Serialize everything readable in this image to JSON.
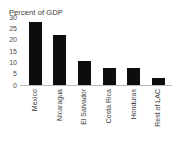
{
  "chart_data": {
    "type": "bar",
    "title": "Percent of GDP",
    "xlabel": "",
    "ylabel": "",
    "ylim": [
      0,
      30
    ],
    "yticks": [
      30,
      25,
      20,
      15,
      10,
      5,
      0
    ],
    "grid": false,
    "legend": false,
    "bar_color": "#0d0d0d",
    "axis_color": "#b9b9b9",
    "background": "#ffffff",
    "categories": [
      "Mexico",
      "Nicaragua",
      "El Salvador",
      "Costa Rica",
      "Honduras",
      "Rest of LAC"
    ],
    "values": [
      28,
      22,
      10.5,
      7.5,
      7.5,
      3
    ]
  }
}
